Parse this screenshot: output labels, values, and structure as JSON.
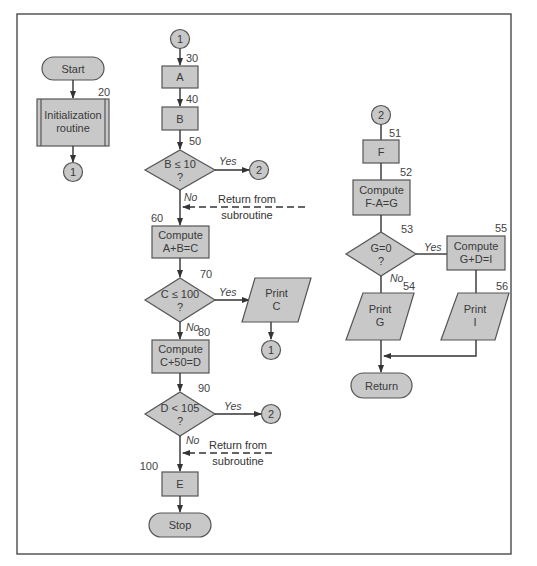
{
  "diagram": {
    "type": "flowchart",
    "frame_color": "#555555",
    "shape_fill": "#c8c8c8",
    "shape_stroke": "#555555",
    "start": {
      "label": "Start"
    },
    "init_routine": {
      "label_line1": "Initialization",
      "label_line2": "routine",
      "number": "20"
    },
    "init_connector": {
      "label": "1"
    },
    "main_entry_connector": {
      "label": "1"
    },
    "box_a": {
      "label": "A",
      "number": "30"
    },
    "box_b": {
      "label": "B",
      "number": "40"
    },
    "decision_b": {
      "line1": "B ≤ 10",
      "line2": "?",
      "number": "50",
      "yes": "Yes",
      "no": "No"
    },
    "decision_b_connector": {
      "label": "2"
    },
    "return_note_1": {
      "line1": "Return from",
      "line2": "subroutine"
    },
    "compute_c": {
      "line1": "Compute",
      "line2": "A+B=C",
      "number": "60"
    },
    "decision_c": {
      "line1": "C ≤ 100",
      "line2": "?",
      "number": "70",
      "yes": "Yes",
      "no": "No"
    },
    "print_c": {
      "line1": "Print",
      "line2": "C"
    },
    "print_c_connector": {
      "label": "1"
    },
    "compute_d": {
      "line1": "Compute",
      "line2": "C+50=D",
      "number": "80"
    },
    "decision_d": {
      "line1": "D < 105",
      "line2": "?",
      "number": "90",
      "yes": "Yes",
      "no": "No"
    },
    "decision_d_connector": {
      "label": "2"
    },
    "return_note_2": {
      "line1": "Return from",
      "line2": "subroutine"
    },
    "box_e": {
      "label": "E",
      "number": "100"
    },
    "stop": {
      "label": "Stop"
    },
    "sub_entry_connector": {
      "label": "2"
    },
    "box_f": {
      "label": "F",
      "number": "51"
    },
    "compute_g": {
      "line1": "Compute",
      "line2": "F-A=G",
      "number": "52"
    },
    "decision_g": {
      "line1": "G=0",
      "line2": "?",
      "number": "53",
      "yes": "Yes",
      "no": "No"
    },
    "compute_i": {
      "line1": "Compute",
      "line2": "G+D=I",
      "number": "55"
    },
    "print_g": {
      "line1": "Print",
      "line2": "G",
      "number": "54"
    },
    "print_i": {
      "line1": "Print",
      "line2": "I",
      "number": "56"
    },
    "return_terminal": {
      "label": "Return"
    }
  }
}
